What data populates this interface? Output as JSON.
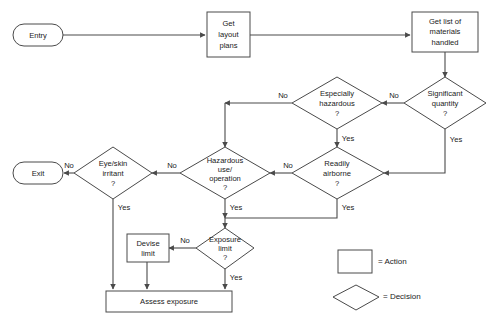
{
  "diagram": {
    "colors": {
      "stroke": "#4a4a4a",
      "fill": "#ffffff",
      "text": "#1a1a1a",
      "background": "#ffffff"
    },
    "nodes": {
      "entry": {
        "label": "Entry",
        "shape": "terminal"
      },
      "exit": {
        "label": "Exit",
        "shape": "terminal"
      },
      "get_layout_plans": {
        "label_line1": "Get",
        "label_line2": "layout",
        "label_line3": "plans",
        "shape": "action"
      },
      "get_list_materials": {
        "label_line1": "Get list of",
        "label_line2": "materials",
        "label_line3": "handled",
        "shape": "action"
      },
      "significant_quantity": {
        "label_line1": "Significant",
        "label_line2": "quantity",
        "label_line3": "?",
        "shape": "decision"
      },
      "especially_hazardous": {
        "label_line1": "Especially",
        "label_line2": "hazardous",
        "label_line3": "?",
        "shape": "decision"
      },
      "hazardous_use": {
        "label_line1": "Hazardous",
        "label_line2": "use/",
        "label_line3": "operation",
        "label_line4": "?",
        "shape": "decision"
      },
      "readily_airborne": {
        "label_line1": "Readily",
        "label_line2": "airborne",
        "label_line3": "?",
        "shape": "decision"
      },
      "eye_skin_irritant": {
        "label_line1": "Eye/skin",
        "label_line2": "irritant",
        "label_line3": "?",
        "shape": "decision"
      },
      "exposure_limit": {
        "label_line1": "Exposure",
        "label_line2": "limit",
        "label_line3": "?",
        "shape": "decision"
      },
      "devise_limit": {
        "label_line1": "Devise",
        "label_line2": "limit",
        "shape": "action"
      },
      "assess_exposure": {
        "label": "Assess exposure",
        "shape": "action"
      }
    },
    "edge_labels": {
      "sig_qty_no": "No",
      "sig_qty_yes": "Yes",
      "esp_haz_no": "No",
      "esp_haz_yes": "Yes",
      "haz_use_no": "No",
      "haz_use_yes": "Yes",
      "airborne_no": "No",
      "airborne_yes": "Yes",
      "irritant_no": "No",
      "irritant_yes": "Yes",
      "exp_limit_no": "No",
      "exp_limit_yes": "Yes"
    },
    "legend": {
      "action": "= Action",
      "decision": "= Decision"
    }
  }
}
